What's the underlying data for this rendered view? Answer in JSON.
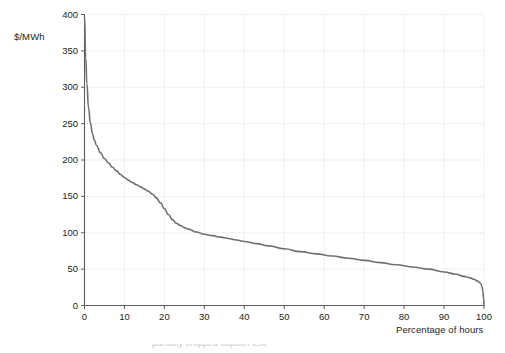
{
  "chart_data": {
    "type": "line",
    "title": "",
    "subtitle": "",
    "xlabel": "Percentage of hours",
    "ylabel": "$/MWh",
    "xlim": [
      0,
      100
    ],
    "ylim": [
      0,
      400
    ],
    "xticks": [
      "0",
      "10",
      "20",
      "30",
      "40",
      "50",
      "60",
      "70",
      "80",
      "90",
      "100"
    ],
    "xtick_values": [
      0,
      10,
      20,
      30,
      40,
      50,
      60,
      70,
      80,
      90,
      100
    ],
    "yticks": [
      "0",
      "50",
      "100",
      "150",
      "200",
      "250",
      "300",
      "350",
      "400"
    ],
    "ytick_values": [
      0,
      50,
      100,
      150,
      200,
      250,
      300,
      350,
      400
    ],
    "grid": true,
    "legend": null,
    "legend_position": "none",
    "annotations": [],
    "series": [
      {
        "name": "Price duration curve",
        "color": "#6f6f6f",
        "linewidth": 1.6,
        "x": [
          0,
          0.3,
          0.6,
          1,
          1.5,
          2,
          2.5,
          3,
          4,
          5,
          6,
          7,
          8,
          9,
          10,
          11,
          12,
          13,
          14,
          15,
          16,
          17,
          18,
          19,
          20,
          21,
          22,
          23,
          24,
          25,
          26,
          28,
          30,
          32,
          34,
          36,
          38,
          40,
          43,
          46,
          50,
          54,
          58,
          62,
          66,
          70,
          74,
          78,
          82,
          86,
          90,
          93,
          95,
          96.5,
          97.5,
          98.3,
          98.8,
          99.2,
          99.5,
          99.7,
          99.9,
          100
        ],
        "y": [
          398,
          340,
          305,
          272,
          250,
          236,
          227,
          220,
          210,
          202,
          196,
          190,
          185,
          180,
          176,
          172,
          169,
          166,
          163,
          160,
          157,
          153,
          148,
          141,
          133,
          125,
          118,
          113,
          110,
          107,
          105,
          101,
          98,
          96,
          94,
          92,
          90,
          88,
          85,
          82,
          78,
          74,
          71,
          68,
          65,
          62,
          59,
          56,
          53,
          50,
          46,
          43,
          40,
          38,
          36,
          34,
          32,
          30,
          26,
          20,
          10,
          0
        ]
      }
    ],
    "colors": {
      "line": "#6f6f6f",
      "axis": "#5c5c5c",
      "grid": "#f0f0f0",
      "text": "#1d1d1d",
      "background": "#ffffff"
    }
  },
  "footer": {
    "cropped_text": "partially cropped caption text"
  }
}
